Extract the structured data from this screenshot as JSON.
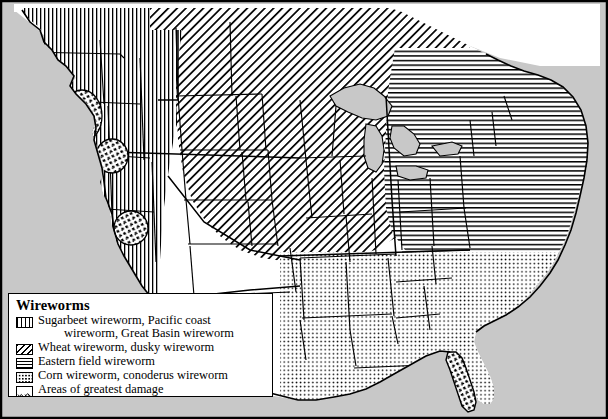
{
  "figure": {
    "kind": "thematic-distribution-map",
    "region": "Continental United States",
    "background_color": "#ffffff",
    "ocean_color": "#c8c8c8",
    "lake_color": "#c8c8c8",
    "line_color": "#000000"
  },
  "legend": {
    "title": "Wireworms",
    "entries": [
      {
        "pattern": "vertical-lines",
        "swatch_class": "sw-vert",
        "label": "Sugarbeet wireworm, Pacific coast",
        "label_cont": "wireworm, Great Basin wireworm",
        "region": "Pacific Northwest and Intermountain West"
      },
      {
        "pattern": "diagonal-hatch",
        "swatch_class": "sw-diag",
        "label": "Wheat wireworm, dusky wireworm",
        "label_cont": "",
        "region": "Northern Plains and Upper Midwest"
      },
      {
        "pattern": "horizontal-lines",
        "swatch_class": "sw-horz",
        "label": "Eastern field wireworm",
        "label_cont": "",
        "region": "Northeast and Mid-Atlantic"
      },
      {
        "pattern": "dots",
        "swatch_class": "sw-dots",
        "label": "Corn wireworm, conoderus wireworm",
        "label_cont": "",
        "region": "Southeast and Gulf States"
      },
      {
        "pattern": "crosshatch-scribble",
        "swatch_class": "sw-cross",
        "label": "Areas of greatest damage",
        "label_cont": "",
        "region": "Localized ovals in the West and Florida"
      }
    ]
  },
  "map_features": {
    "damage_zones": [
      {
        "name": "pacific-northwest-damage-oval",
        "cx": 82,
        "cy": 116,
        "rx": 20,
        "ry": 26
      },
      {
        "name": "great-basin-damage-oval",
        "cx": 112,
        "cy": 156,
        "rx": 16,
        "ry": 17
      },
      {
        "name": "southwest-damage-oval",
        "cx": 131,
        "cy": 228,
        "rx": 17,
        "ry": 17
      },
      {
        "name": "florida-damage-oval",
        "cx": 466,
        "cy": 381,
        "rx": 17,
        "ry": 26
      }
    ],
    "unhatched_states_note": "Texas, Oklahoma, New Mexico, Arizona and southern Plains shown white"
  }
}
